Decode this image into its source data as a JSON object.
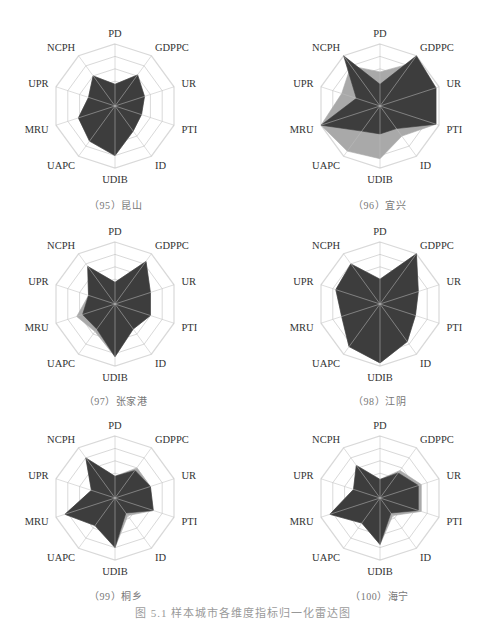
{
  "figure": {
    "caption": "图 5.1  样本城市各维度指标归一化雷达图"
  },
  "chart_data": [
    {
      "type": "radar",
      "title": "（95）昆山",
      "axes": [
        "PD",
        "GDPPC",
        "UR",
        "PTI",
        "ID",
        "UDIB",
        "UAPC",
        "MRU",
        "UPR",
        "NCPH"
      ],
      "range": [
        0,
        1
      ],
      "rings": 5,
      "series": [
        {
          "name": "series-light",
          "color": "#a9a9a9",
          "values": [
            0.35,
            0.62,
            0.5,
            0.45,
            0.5,
            0.8,
            0.7,
            0.62,
            0.45,
            0.6
          ]
        },
        {
          "name": "series-dark",
          "color": "#3d3d3d",
          "values": [
            0.35,
            0.62,
            0.5,
            0.45,
            0.5,
            0.8,
            0.7,
            0.62,
            0.45,
            0.6
          ]
        }
      ]
    },
    {
      "type": "radar",
      "title": "（96）宜兴",
      "axes": [
        "PD",
        "GDPPC",
        "UR",
        "PTI",
        "ID",
        "UDIB",
        "UAPC",
        "MRU",
        "UPR",
        "NCPH"
      ],
      "range": [
        0,
        1
      ],
      "rings": 5,
      "series": [
        {
          "name": "series-light",
          "color": "#a9a9a9",
          "values": [
            0.55,
            0.85,
            0.95,
            0.95,
            0.6,
            0.85,
            0.9,
            1.0,
            0.65,
            0.8
          ]
        },
        {
          "name": "series-dark",
          "color": "#3d3d3d",
          "values": [
            0.35,
            1.0,
            0.95,
            0.95,
            0.45,
            0.45,
            0.5,
            1.0,
            0.4,
            1.0
          ]
        }
      ]
    },
    {
      "type": "radar",
      "title": "（97）张家港",
      "axes": [
        "PD",
        "GDPPC",
        "UR",
        "PTI",
        "ID",
        "UDIB",
        "UAPC",
        "MRU",
        "UPR",
        "NCPH"
      ],
      "range": [
        0,
        1
      ],
      "rings": 5,
      "series": [
        {
          "name": "series-light",
          "color": "#a9a9a9",
          "values": [
            0.35,
            0.85,
            0.6,
            0.6,
            0.5,
            0.85,
            0.55,
            0.65,
            0.45,
            0.75
          ]
        },
        {
          "name": "series-dark",
          "color": "#3d3d3d",
          "values": [
            0.35,
            0.85,
            0.6,
            0.6,
            0.5,
            0.85,
            0.5,
            0.55,
            0.45,
            0.75
          ]
        }
      ]
    },
    {
      "type": "radar",
      "title": "（98）江阴",
      "axes": [
        "PD",
        "GDPPC",
        "UR",
        "PTI",
        "ID",
        "UDIB",
        "UAPC",
        "MRU",
        "UPR",
        "NCPH"
      ],
      "range": [
        0,
        1
      ],
      "rings": 5,
      "series": [
        {
          "name": "series-light",
          "color": "#a9a9a9",
          "values": [
            0.4,
            1.0,
            0.65,
            0.6,
            0.75,
            0.95,
            0.85,
            0.65,
            0.75,
            0.8
          ]
        },
        {
          "name": "series-dark",
          "color": "#3d3d3d",
          "values": [
            0.4,
            1.0,
            0.65,
            0.6,
            0.75,
            0.95,
            0.85,
            0.65,
            0.75,
            0.8
          ]
        }
      ]
    },
    {
      "type": "radar",
      "title": "（99）桐乡",
      "axes": [
        "PD",
        "GDPPC",
        "UR",
        "PTI",
        "ID",
        "UDIB",
        "UAPC",
        "MRU",
        "UPR",
        "NCPH"
      ],
      "range": [
        0,
        1
      ],
      "rings": 5,
      "series": [
        {
          "name": "series-light",
          "color": "#a9a9a9",
          "values": [
            0.35,
            0.6,
            0.6,
            0.65,
            0.35,
            0.8,
            0.55,
            0.85,
            0.4,
            0.8
          ]
        },
        {
          "name": "series-dark",
          "color": "#3d3d3d",
          "values": [
            0.35,
            0.55,
            0.6,
            0.65,
            0.3,
            0.8,
            0.55,
            0.85,
            0.4,
            0.8
          ]
        }
      ]
    },
    {
      "type": "radar",
      "title": "（100）海宁",
      "axes": [
        "PD",
        "GDPPC",
        "UR",
        "PTI",
        "ID",
        "UDIB",
        "UAPC",
        "MRU",
        "UPR",
        "NCPH"
      ],
      "range": [
        0,
        1
      ],
      "rings": 5,
      "series": [
        {
          "name": "series-light",
          "color": "#a9a9a9",
          "values": [
            0.3,
            0.55,
            0.7,
            0.7,
            0.35,
            0.75,
            0.5,
            0.85,
            0.45,
            0.65
          ]
        },
        {
          "name": "series-dark",
          "color": "#3d3d3d",
          "values": [
            0.3,
            0.5,
            0.65,
            0.65,
            0.3,
            0.75,
            0.5,
            0.85,
            0.45,
            0.65
          ]
        }
      ]
    }
  ],
  "colors": {
    "grid": "#d9d9d9",
    "spoke": "#bdbdbd",
    "dark": "#3d3d3d",
    "light": "#a9a9a9"
  }
}
